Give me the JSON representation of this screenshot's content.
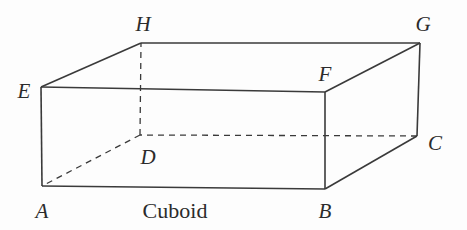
{
  "figure": {
    "name": "Cuboid",
    "caption": "Cuboid",
    "caption_position": {
      "x": 175,
      "y": 211
    },
    "background_color": "#fdfdfd",
    "stroke_color": "#3a3a3a",
    "stroke_width": 1.6,
    "dash_pattern": "6 5",
    "width": 467,
    "height": 230
  },
  "vertices": [
    {
      "id": "A",
      "label": "A",
      "x": 42,
      "y": 186,
      "label_x": 42,
      "label_y": 211,
      "hidden": false
    },
    {
      "id": "B",
      "label": "B",
      "x": 325,
      "y": 189,
      "label_x": 325,
      "label_y": 211,
      "hidden": false
    },
    {
      "id": "C",
      "label": "C",
      "x": 417,
      "y": 136,
      "label_x": 435,
      "label_y": 143,
      "hidden": false
    },
    {
      "id": "D",
      "label": "D",
      "x": 140,
      "y": 135,
      "label_x": 148,
      "label_y": 157,
      "hidden": true
    },
    {
      "id": "E",
      "label": "E",
      "x": 41,
      "y": 87,
      "label_x": 24,
      "label_y": 91,
      "hidden": false
    },
    {
      "id": "F",
      "label": "F",
      "x": 325,
      "y": 92,
      "label_x": 325,
      "label_y": 74,
      "hidden": false
    },
    {
      "id": "G",
      "label": "G",
      "x": 420,
      "y": 43,
      "label_x": 423,
      "label_y": 24,
      "hidden": false
    },
    {
      "id": "H",
      "label": "H",
      "x": 141,
      "y": 43,
      "label_x": 143,
      "label_y": 24,
      "hidden": false
    }
  ],
  "edges": [
    {
      "from": "A",
      "to": "B",
      "style": "solid",
      "name": "edge-AB"
    },
    {
      "from": "B",
      "to": "C",
      "style": "solid",
      "name": "edge-BC"
    },
    {
      "from": "C",
      "to": "D",
      "style": "dashed",
      "name": "edge-CD"
    },
    {
      "from": "D",
      "to": "A",
      "style": "dashed",
      "name": "edge-DA"
    },
    {
      "from": "E",
      "to": "F",
      "style": "solid",
      "name": "edge-EF"
    },
    {
      "from": "F",
      "to": "G",
      "style": "solid",
      "name": "edge-FG"
    },
    {
      "from": "G",
      "to": "H",
      "style": "solid",
      "name": "edge-GH"
    },
    {
      "from": "H",
      "to": "E",
      "style": "solid",
      "name": "edge-HE"
    },
    {
      "from": "A",
      "to": "E",
      "style": "solid",
      "name": "edge-AE"
    },
    {
      "from": "B",
      "to": "F",
      "style": "solid",
      "name": "edge-BF"
    },
    {
      "from": "C",
      "to": "G",
      "style": "solid",
      "name": "edge-CG"
    },
    {
      "from": "D",
      "to": "H",
      "style": "dashed",
      "name": "edge-DH"
    }
  ]
}
